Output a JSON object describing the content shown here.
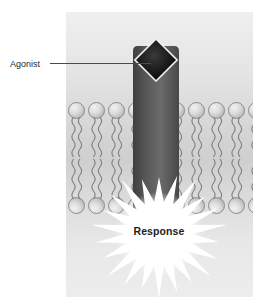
{
  "figure": {
    "top_caption": ""
  },
  "labels": {
    "agonist": "Agonist",
    "response": "Response"
  },
  "icons": {
    "agonist_shape": "diamond-icon",
    "receptor_shape": "receptor-protein-icon",
    "burst_shape": "starburst-icon",
    "lipid_shape": "phospholipid-icon"
  },
  "colors": {
    "receptor_dark": "#4a4a4a",
    "receptor_light": "#6e6e6e",
    "agonist_fill": "#141414",
    "agonist_border": "#e8e8e8",
    "membrane_head": "#c9c9c9",
    "membrane_tail": "#7e7e7e",
    "burst_fill": "#ffffff",
    "label_text": "#2b2b2b",
    "panel_bg_top": "#efefef",
    "panel_bg_mid": "#cfcfcf",
    "panel_bg_bottom": "#ededed"
  },
  "structure": {
    "lipid_count_per_row": 9,
    "bilayer_rows": 2
  }
}
